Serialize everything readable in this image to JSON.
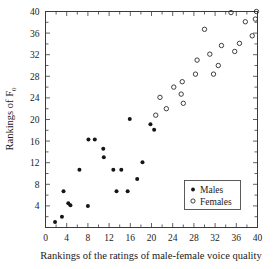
{
  "chart_data": {
    "type": "scatter",
    "title": "",
    "xlabel": "Rankings of the ratings of male-female voice quality",
    "ylabel": "Rankings of F",
    "ylabel_subscript": "0",
    "xlim": [
      0,
      40
    ],
    "ylim": [
      0,
      40
    ],
    "xticks": [
      0,
      4,
      8,
      12,
      16,
      20,
      24,
      28,
      32,
      36,
      40
    ],
    "yticks": [
      0,
      4,
      8,
      12,
      16,
      20,
      24,
      28,
      32,
      36,
      40
    ],
    "xtick_labels": [
      "0",
      "4",
      "8",
      "12",
      "16",
      "20",
      "24",
      "28",
      "32",
      "36",
      "40"
    ],
    "ytick_labels": [
      "0",
      "4",
      "8",
      "12",
      "16",
      "20",
      "24",
      "28",
      "32",
      "36",
      "40"
    ],
    "minor_tick_step": 2,
    "grid": false,
    "legend_position": "lower-right",
    "series": [
      {
        "name": "Males",
        "marker": "filled-circle",
        "color": "#151515",
        "points": [
          [
            1.8,
            1.0
          ],
          [
            3.1,
            2.0
          ],
          [
            3.4,
            6.7
          ],
          [
            4.3,
            4.5
          ],
          [
            4.7,
            4.1
          ],
          [
            6.4,
            10.7
          ],
          [
            8.0,
            4.0
          ],
          [
            8.1,
            16.3
          ],
          [
            9.3,
            16.3
          ],
          [
            10.9,
            14.6
          ],
          [
            11.0,
            13.0
          ],
          [
            12.8,
            10.7
          ],
          [
            13.4,
            6.7
          ],
          [
            14.3,
            10.7
          ],
          [
            15.5,
            6.7
          ],
          [
            15.9,
            20.1
          ],
          [
            17.3,
            9.0
          ],
          [
            18.3,
            12.1
          ],
          [
            19.8,
            19.1
          ],
          [
            20.5,
            18.1
          ]
        ]
      },
      {
        "name": "Females",
        "marker": "open-circle",
        "color": "#2a2a2a",
        "points": [
          [
            20.8,
            20.8
          ],
          [
            21.6,
            24.1
          ],
          [
            22.8,
            22.0
          ],
          [
            24.2,
            26.0
          ],
          [
            25.6,
            24.7
          ],
          [
            25.8,
            27.0
          ],
          [
            26.0,
            23.0
          ],
          [
            28.3,
            28.4
          ],
          [
            28.6,
            31.0
          ],
          [
            30.0,
            36.7
          ],
          [
            31.0,
            32.1
          ],
          [
            31.7,
            28.4
          ],
          [
            32.6,
            30.0
          ],
          [
            33.2,
            33.7
          ],
          [
            35.0,
            39.8
          ],
          [
            35.7,
            32.6
          ],
          [
            36.6,
            34.1
          ],
          [
            37.7,
            38.1
          ],
          [
            39.0,
            35.5
          ],
          [
            39.6,
            38.6
          ],
          [
            39.8,
            40.0
          ]
        ]
      }
    ]
  },
  "legend": {
    "entries": [
      {
        "label": "Males",
        "marker": "filled-circle"
      },
      {
        "label": "Females",
        "marker": "open-circle"
      }
    ]
  }
}
